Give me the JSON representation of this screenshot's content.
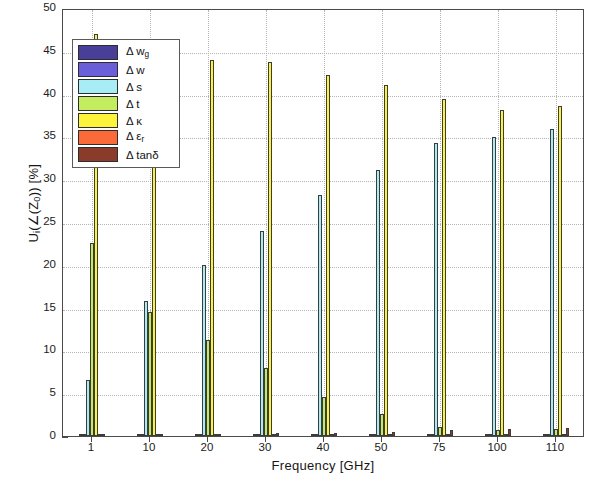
{
  "chart_data": {
    "type": "bar",
    "title": "",
    "xlabel": "Frequency [GHz]",
    "ylabel": "U_i(∠(Z_0)) [%]",
    "ylabel_parts": {
      "main": "U",
      "sub1": "i",
      "mid": "(∠(Z",
      "sub2": "0",
      "end": ")) [%]"
    },
    "categories": [
      "1",
      "10",
      "20",
      "30",
      "40",
      "50",
      "75",
      "100",
      "110"
    ],
    "xticklabels": [
      "1",
      "10",
      "20",
      "30",
      "40",
      "50",
      "75",
      "100",
      "110"
    ],
    "yticklabels": [
      "0",
      "5",
      "10",
      "15",
      "20",
      "25",
      "30",
      "35",
      "40",
      "45",
      "50"
    ],
    "ylim": [
      0,
      50
    ],
    "ytick_step": 5,
    "grid": "dotted-both",
    "legend_position": "upper-left-inside",
    "series": [
      {
        "name": "Δ w_g",
        "label_main": "Δ w",
        "label_sub": "g",
        "color": "#4a3f98",
        "values": [
          0.05,
          0.05,
          0.05,
          0.05,
          0.05,
          0.05,
          0.05,
          0.05,
          0.05
        ]
      },
      {
        "name": "Δ w",
        "label_main": "Δ w",
        "label_sub": "",
        "color": "#6a5fd8",
        "values": [
          0.05,
          0.05,
          0.05,
          0.05,
          0.05,
          0.05,
          0.05,
          0.05,
          0.05
        ]
      },
      {
        "name": "Δ s",
        "label_main": "Δ s",
        "label_sub": "",
        "color": "#a8ecf5",
        "values": [
          6.5,
          15.8,
          20.0,
          24.0,
          28.1,
          31.1,
          34.2,
          34.9,
          35.9
        ]
      },
      {
        "name": "Δ t",
        "label_main": "Δ t",
        "label_sub": "",
        "color": "#c3ed5e",
        "values": [
          22.5,
          14.5,
          11.2,
          8.0,
          4.5,
          2.6,
          1.0,
          0.7,
          0.8
        ]
      },
      {
        "name": "Δ κ",
        "label_main": "Δ κ",
        "label_sub": "",
        "color": "#fbf43a",
        "values": [
          47.0,
          44.2,
          43.9,
          43.7,
          42.2,
          41.0,
          39.4,
          38.1,
          38.5
        ]
      },
      {
        "name": "Δ ε_r",
        "label_main": "Δ ε",
        "label_sub": "r",
        "color": "#fb6b3a",
        "values": [
          0.05,
          0.05,
          0.05,
          0.05,
          0.05,
          0.05,
          0.05,
          0.05,
          0.05
        ]
      },
      {
        "name": "Δ tanδ",
        "label_main": "Δ tanδ",
        "label_sub": "",
        "color": "#8a3b2a",
        "values": [
          0.1,
          0.15,
          0.2,
          0.3,
          0.4,
          0.5,
          0.7,
          0.8,
          0.9
        ]
      }
    ]
  },
  "legend": {
    "items": [
      {
        "label": "Δ w",
        "sub": "g",
        "color": "#4a3f98"
      },
      {
        "label": "Δ w",
        "sub": "",
        "color": "#6a5fd8"
      },
      {
        "label": "Δ s",
        "sub": "",
        "color": "#a8ecf5"
      },
      {
        "label": "Δ t",
        "sub": "",
        "color": "#c3ed5e"
      },
      {
        "label": "Δ κ",
        "sub": "",
        "color": "#fbf43a"
      },
      {
        "label": "Δ ε",
        "sub": "r",
        "color": "#fb6b3a"
      },
      {
        "label": "Δ tanδ",
        "sub": "",
        "color": "#8a3b2a"
      }
    ]
  },
  "axes": {
    "x_title": "Frequency [GHz]",
    "y_title_main": "U",
    "y_title_sub_i": "i",
    "y_title_mid": "(∠(Z",
    "y_title_sub_0": "0",
    "y_title_end": ")) [%]"
  }
}
